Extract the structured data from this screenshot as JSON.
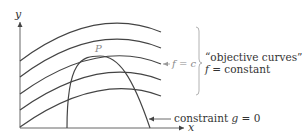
{
  "diagram": {
    "axes": {
      "x_label": "x",
      "y_label": "y"
    },
    "point_label": "P",
    "level_label": {
      "lhs": "f",
      "eq": " = ",
      "rhs": "c"
    },
    "brace_annotation": {
      "line1": "“objective curves”",
      "line2_lhs": "f",
      "line2_rest": " = constant"
    },
    "constraint_label": {
      "text": "constraint ",
      "var": "g",
      "rest": " = 0"
    },
    "colors": {
      "curve": "#444444",
      "axis": "#555555",
      "label_gray": "#8a8a8a",
      "label_dark": "#333333"
    },
    "objective_curve_count": 5
  }
}
